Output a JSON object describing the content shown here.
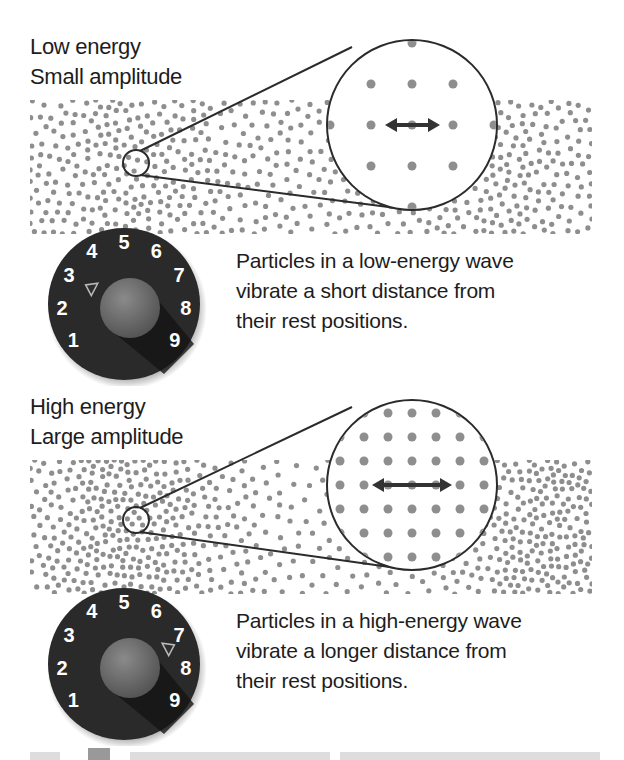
{
  "panels": [
    {
      "id": "low",
      "title_lines": [
        "Low energy",
        "Small amplitude"
      ],
      "description_lines": [
        "Particles in a low-energy wave",
        "vibrate a short distance from",
        "their rest positions."
      ],
      "dial": {
        "numbers": [
          "1",
          "2",
          "3",
          "4",
          "5",
          "6",
          "7",
          "8",
          "9"
        ],
        "setting": "3"
      },
      "magnifier": {
        "grid": "3x3 plus edge dots",
        "arrow": "short double-headed arrow"
      }
    },
    {
      "id": "high",
      "title_lines": [
        "High energy",
        "Large amplitude"
      ],
      "description_lines": [
        "Particles in a high-energy wave",
        "vibrate a longer distance from",
        "their rest positions."
      ],
      "dial": {
        "numbers": [
          "1",
          "2",
          "3",
          "4",
          "5",
          "6",
          "7",
          "8",
          "9"
        ],
        "setting": "7"
      },
      "magnifier": {
        "grid": "dense 7x7 grid",
        "arrow": "long double-headed arrow"
      }
    }
  ],
  "colors": {
    "particle": "#8e8e8e",
    "outline": "#2b2b2b",
    "dial_body": "#2a2a2a",
    "knob": "#6a6a6a",
    "text": "#1d1d1d"
  }
}
